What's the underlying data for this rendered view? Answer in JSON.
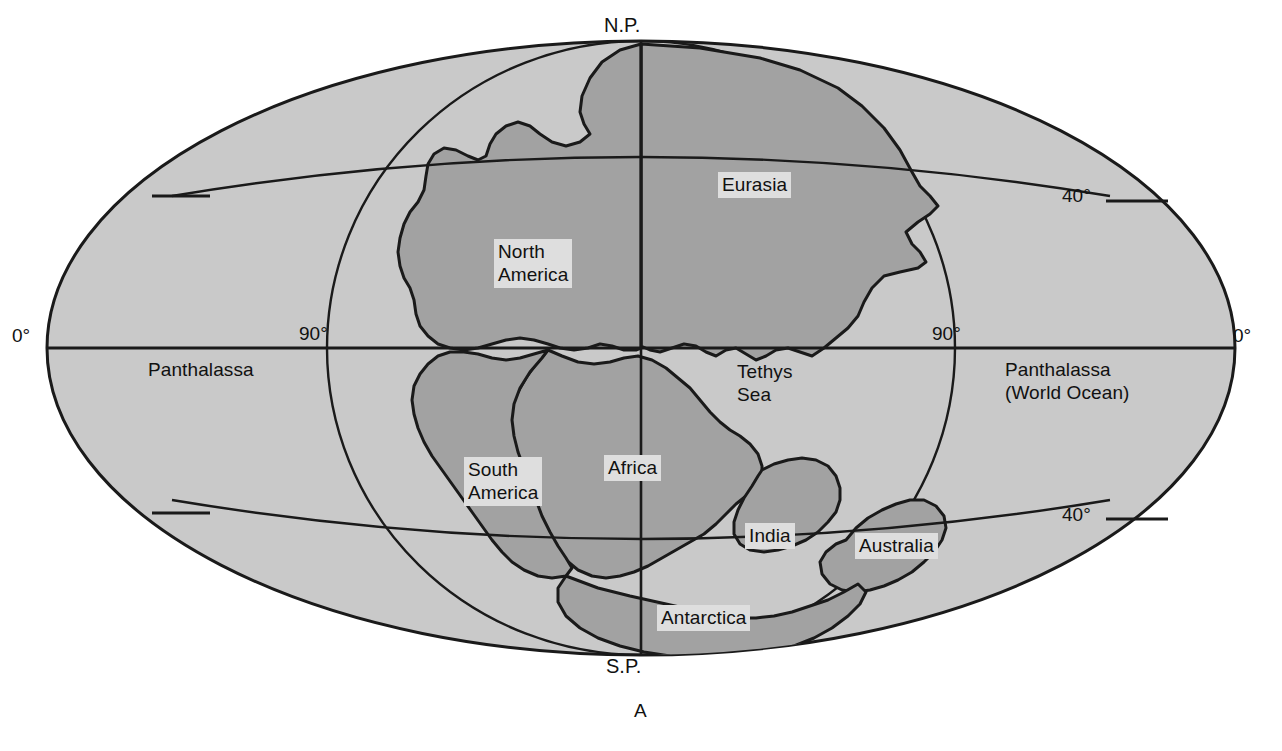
{
  "figure": {
    "caption": "A",
    "projection": "oval / Mollweide-style world map",
    "colors": {
      "ocean_fill": "#c9c9c9",
      "land_fill": "#a2a2a2",
      "outline": "#1a1a1a",
      "label_halo": "#dedede",
      "background": "#ffffff",
      "text": "#111111"
    }
  },
  "poles": {
    "north": "N.P.",
    "south": "S.P."
  },
  "oceans": [
    {
      "id": "panthalassa-left",
      "name": "Panthalassa"
    },
    {
      "id": "panthalassa-right",
      "name": "Panthalassa",
      "subtitle": "(World Ocean)"
    },
    {
      "id": "tethys",
      "name": "Tethys",
      "subtitle": "Sea"
    }
  ],
  "continents": [
    {
      "id": "eurasia",
      "label": "Eurasia"
    },
    {
      "id": "north-america",
      "label": "North\nAmerica"
    },
    {
      "id": "south-america",
      "label": "South\nAmerica"
    },
    {
      "id": "africa",
      "label": "Africa"
    },
    {
      "id": "india",
      "label": "India"
    },
    {
      "id": "australia",
      "label": "Australia"
    },
    {
      "id": "antarctica",
      "label": "Antarctica"
    }
  ],
  "graticule": {
    "meridians": [
      {
        "id": "left-edge",
        "label": "0°",
        "position": "outer-left"
      },
      {
        "id": "left-inner",
        "label": "90°",
        "position": "inner-left"
      },
      {
        "id": "right-inner",
        "label": "90°",
        "position": "inner-right"
      },
      {
        "id": "right-edge",
        "label": "0°",
        "position": "outer-right"
      }
    ],
    "parallels": [
      {
        "id": "north-40-right",
        "label": "40°",
        "side": "right",
        "hemisphere": "north"
      },
      {
        "id": "south-40-right",
        "label": "40°",
        "side": "right",
        "hemisphere": "south"
      },
      {
        "id": "north-40-left",
        "label": "",
        "side": "left",
        "hemisphere": "north"
      },
      {
        "id": "south-40-left",
        "label": "",
        "side": "left",
        "hemisphere": "south"
      }
    ],
    "equator": {
      "id": "equator",
      "label": ""
    },
    "central_meridian": {
      "id": "central-meridian",
      "label": ""
    }
  }
}
